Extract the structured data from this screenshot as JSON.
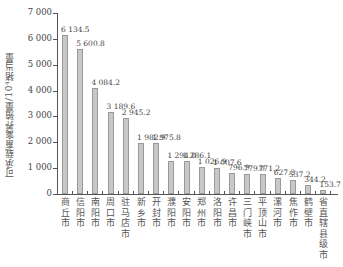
{
  "chart_data": {
    "type": "bar",
    "title": "",
    "xlabel": "",
    "ylabel": "可承载畜禽养殖量/10⁴猪当量",
    "ylim": [
      0,
      7000
    ],
    "yticks": [
      "0",
      "1 000",
      "2 000",
      "3 000",
      "4 000",
      "5 000",
      "6 000",
      "7 000"
    ],
    "grid": false,
    "legend": null,
    "categories": [
      "商丘市",
      "信阳市",
      "南阳市",
      "周口市",
      "驻马店市",
      "新乡市",
      "开封市",
      "濮阳市",
      "安阳市",
      "郑州市",
      "洛阳市",
      "许昌市",
      "三门峡市",
      "平顶山市",
      "漯河市",
      "焦作市",
      "鹤壁市",
      "省直辖县级市"
    ],
    "values": [
      6134.5,
      5600.8,
      4084.2,
      3189.6,
      2945.2,
      1982.9,
      1975.8,
      1294.0,
      1286.1,
      1026.9,
      1007.6,
      796.9,
      779.0,
      771.2,
      627.3,
      537.2,
      344.2,
      153.7
    ],
    "value_labels": [
      "6 134.5",
      "5 600.8",
      "4 084.2",
      "3 189.6",
      "2 945.2",
      "1 982.9",
      "1 975.8",
      "1 294.0",
      "1 286.1",
      "1 026.9",
      "1 007.6",
      "796.9",
      "779.0",
      "771.2",
      "627.3",
      "537.2",
      "344.2",
      "153.7"
    ],
    "colors": {
      "bar_fill": "#c8c8c8",
      "bar_edge": "#9a9a9a",
      "axis": "#555555"
    }
  }
}
